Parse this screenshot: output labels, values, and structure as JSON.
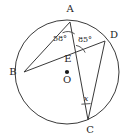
{
  "figure": {
    "type": "circle-geometry-diagram",
    "background_color": "#ffffff",
    "line_color": "#3a3a3a",
    "text_color": "#242424",
    "width": 131,
    "height": 138
  },
  "circle": {
    "name": "circle-O",
    "center": {
      "x": 67,
      "y": 72
    },
    "radius": 52
  },
  "center_point": {
    "label": "O",
    "x": 67,
    "y": 72,
    "marker": "filled-dot"
  },
  "points": [
    {
      "id": "A",
      "label": "A",
      "x": 70,
      "y": 22,
      "label_x": 70,
      "label_y": 12,
      "on_circle": true
    },
    {
      "id": "B",
      "label": "B",
      "x": 24,
      "y": 72,
      "label_x": 13,
      "label_y": 75,
      "on_circle": true
    },
    {
      "id": "C",
      "label": "C",
      "x": 88,
      "y": 120,
      "label_x": 90,
      "label_y": 133,
      "on_circle": true
    },
    {
      "id": "D",
      "label": "D",
      "x": 105,
      "y": 41,
      "label_x": 113,
      "label_y": 38,
      "on_circle": true
    },
    {
      "id": "E",
      "label": "E",
      "x": 73,
      "y": 58,
      "label_x": 68,
      "label_y": 62,
      "on_circle": false
    }
  ],
  "chords": [
    {
      "id": "AB",
      "from": "A",
      "to": "B"
    },
    {
      "id": "AC",
      "from": "A",
      "to": "C"
    },
    {
      "id": "BD",
      "from": "B",
      "to": "D"
    },
    {
      "id": "DC",
      "from": "D",
      "to": "C"
    }
  ],
  "angles": [
    {
      "id": "angle-at-A",
      "vertex": "A",
      "label": "58°",
      "label_x": 60,
      "label_y": 37,
      "arc": "M 62.5 32.8 A 12 12 0 0 1 74.7 33.9",
      "between": [
        "AB",
        "AC"
      ]
    },
    {
      "id": "angle-at-E",
      "vertex": "E",
      "label": "85°",
      "label_x": 82,
      "label_y": 40,
      "arc": "M 85.2 52.6 A 13 13 0 0 0 76.0 45.4",
      "between": [
        "ED",
        "EC"
      ]
    },
    {
      "id": "angle-at-C",
      "vertex": "C",
      "label": "x",
      "label_x": 85,
      "label_y": 99,
      "arc": "M 81.0 104.0 L 90.3 103.5",
      "between": [
        "CA",
        "CD"
      ]
    }
  ]
}
